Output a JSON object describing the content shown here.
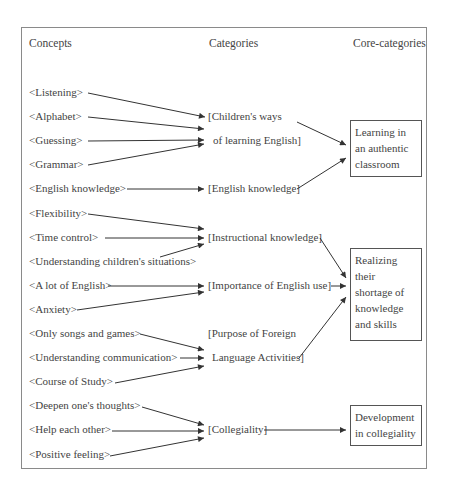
{
  "headers": {
    "concepts": "Concepts",
    "categories": "Categories",
    "core_categories": "Core-categories"
  },
  "concepts": [
    "<Listening>",
    "<Alphabet>",
    "<Guessing>",
    "<Grammar>",
    "<English knowledge>",
    "<Flexibility>",
    "<Time control>",
    "<Understanding children's situations>",
    "<A lot of English>",
    "<Anxiety>",
    "<Only songs and games>",
    "<Understanding communication>",
    "<Course of Study>",
    "<Deepen one's thoughts>",
    "<Help each other>",
    "<Positive feeling>"
  ],
  "categories": [
    {
      "line1": "[Children's ways",
      "line2": "of learning English]"
    },
    {
      "line1": "[English knowledge]"
    },
    {
      "line1": "[Instructional knowledge]"
    },
    {
      "line1": "[Importance of English use]"
    },
    {
      "line1": "[Purpose of Foreign",
      "line2": "Language Activities]"
    },
    {
      "line1": "[Collegiality]"
    }
  ],
  "core_categories": [
    {
      "lines": [
        "Learning in",
        "an authentic",
        "classroom"
      ]
    },
    {
      "lines": [
        "Realizing",
        "their",
        "shortage of",
        "knowledge",
        "and skills"
      ]
    },
    {
      "lines": [
        "Development",
        "in collegiality"
      ]
    }
  ],
  "links": {
    "concept_to_category": [
      [
        "<Listening>",
        "[Children's ways of learning English]"
      ],
      [
        "<Alphabet>",
        "[Children's ways of learning English]"
      ],
      [
        "<Guessing>",
        "[Children's ways of learning English]"
      ],
      [
        "<Grammar>",
        "[Children's ways of learning English]"
      ],
      [
        "<English knowledge>",
        "[English knowledge]"
      ],
      [
        "<Flexibility>",
        "[Instructional knowledge]"
      ],
      [
        "<Time control>",
        "[Instructional knowledge]"
      ],
      [
        "<Understanding children's situations>",
        "[Instructional knowledge]"
      ],
      [
        "<A lot of English>",
        "[Importance of English use]"
      ],
      [
        "<Anxiety>",
        "[Importance of English use]"
      ],
      [
        "<Only songs and games>",
        "[Purpose of Foreign Language Activities]"
      ],
      [
        "<Understanding communication>",
        "[Purpose of Foreign Language Activities]"
      ],
      [
        "<Course of Study>",
        "[Purpose of Foreign Language Activities]"
      ],
      [
        "<Deepen one's thoughts>",
        "[Collegiality]"
      ],
      [
        "<Help each other>",
        "[Collegiality]"
      ],
      [
        "<Positive feeling>",
        "[Collegiality]"
      ]
    ],
    "category_to_core": [
      [
        "[Children's ways of learning English]",
        "Learning in an authentic classroom"
      ],
      [
        "[English knowledge]",
        "Learning in an authentic classroom"
      ],
      [
        "[Instructional knowledge]",
        "Realizing their shortage of knowledge and skills"
      ],
      [
        "[Importance of English use]",
        "Realizing their shortage of knowledge and skills"
      ],
      [
        "[Purpose of Foreign Language Activities]",
        "Realizing their shortage of knowledge and skills"
      ],
      [
        "[Collegiality]",
        "Development in collegiality"
      ]
    ]
  }
}
